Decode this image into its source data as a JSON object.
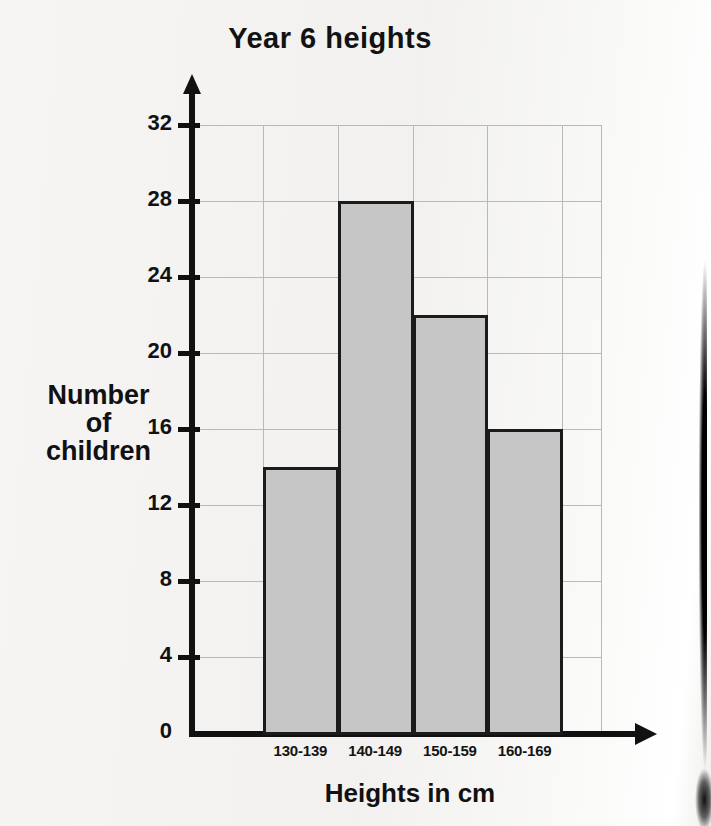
{
  "chart_data": {
    "type": "bar",
    "title": "Year 6 heights",
    "xlabel": "Heights in cm",
    "ylabel": "Number of children",
    "ylabel_lines": [
      "Number",
      "of",
      "children"
    ],
    "categories": [
      "130-139",
      "140-149",
      "150-159",
      "160-169"
    ],
    "values": [
      14,
      28,
      22,
      16
    ],
    "yticks": [
      0,
      4,
      8,
      12,
      16,
      20,
      24,
      28,
      32
    ],
    "ylim": [
      0,
      32
    ],
    "grid": true,
    "legend": "none",
    "bar_fill_color": "#c6c6c6",
    "bar_border_color": "#1b1b1b",
    "axis_color": "#111111",
    "gridline_color": "#b9b9b9",
    "background_color": "#f3f2f0",
    "bars_touching": true
  }
}
